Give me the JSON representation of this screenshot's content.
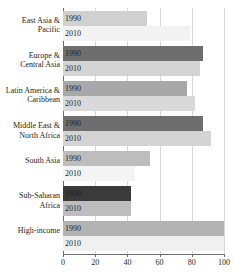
{
  "chart_data": {
    "type": "bar",
    "orientation": "horizontal",
    "title": "",
    "xlabel": "",
    "ylabel": "",
    "xlim": [
      0,
      100
    ],
    "xticks": [
      0,
      20,
      40,
      60,
      80,
      100
    ],
    "xtick_labels": [
      "0",
      "20",
      "40",
      "60",
      "80",
      "100"
    ],
    "grid": true,
    "grid_axis": "x",
    "legend": "none",
    "categories": [
      "East Asia &\nPacific",
      "Europe &\nCentral Asia",
      "Latin America &\nCaribbean",
      "Middle East &\nNorth Africa",
      "South Asia",
      "Sub-Saharan\nAfrica",
      "High-income"
    ],
    "series": [
      {
        "name": "1990",
        "values": [
          52,
          87,
          77,
          87,
          54,
          42,
          100
        ]
      },
      {
        "name": "2010",
        "values": [
          79,
          85,
          82,
          92,
          45,
          42,
          100
        ]
      }
    ],
    "bar_colors": {
      "series_1990": [
        "#d0d0d0",
        "#6e6e6e",
        "#a8a8a8",
        "#6e6e6e",
        "#bdbdbd",
        "#3a3a3a",
        "#b3b3b3"
      ],
      "series_2010": [
        "#f2f2f2",
        "#d4d4d4",
        "#d9d9d9",
        "#d4d4d4",
        "#f4f4f4",
        "#bdbdbd",
        "#f0f0f0"
      ]
    },
    "palette": {
      "axis": "#6d6d6d",
      "gridline": "#d7d7d7",
      "text": "#231f20",
      "background": "#ffffff"
    },
    "bar_value_labels": [
      [
        "1990",
        "2010"
      ],
      [
        "1990",
        "2010"
      ],
      [
        "1990",
        "2010"
      ],
      [
        "1990",
        "2010"
      ],
      [
        "1990",
        "2010"
      ],
      [
        "1990",
        "2010"
      ],
      [
        "1990",
        "2010"
      ]
    ]
  }
}
